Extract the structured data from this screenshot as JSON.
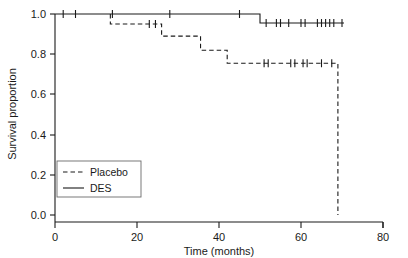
{
  "chart_data": {
    "type": "line",
    "title": "",
    "xlabel": "Time (months)",
    "ylabel": "Survival proportion",
    "xlim": [
      0,
      80
    ],
    "ylim": [
      0.0,
      1.0
    ],
    "grid": false,
    "legend_position": "lower left",
    "xticks": [
      0,
      20,
      40,
      60,
      80
    ],
    "xtick_labels": [
      "0",
      "20",
      "40",
      "60",
      "80"
    ],
    "yticks": [
      0.0,
      0.2,
      0.4,
      0.6,
      0.8,
      1.0
    ],
    "ytick_labels": [
      "0.0",
      "0.2",
      "0.4",
      "0.6",
      "0.8",
      "1.0"
    ],
    "series": [
      {
        "name": "Placebo",
        "style": "dashed",
        "color": "#1a1a1a",
        "step_points": [
          {
            "t": 13.5,
            "s": 1.0
          },
          {
            "t": 13.5,
            "s": 0.95
          },
          {
            "t": 26.0,
            "s": 0.95
          },
          {
            "t": 26.0,
            "s": 0.89
          },
          {
            "t": 35.5,
            "s": 0.89
          },
          {
            "t": 35.5,
            "s": 0.82
          },
          {
            "t": 42.0,
            "s": 0.82
          },
          {
            "t": 42.0,
            "s": 0.755
          },
          {
            "t": 69.0,
            "s": 0.755
          },
          {
            "t": 69.0,
            "s": 0.0
          }
        ],
        "censor_times": [
          23.0,
          24.5,
          51.0,
          52.0,
          57.5,
          58.5,
          60.5,
          61.5,
          65.0,
          67.5
        ],
        "censor_values": [
          0.95,
          0.95,
          0.755,
          0.755,
          0.755,
          0.755,
          0.755,
          0.755,
          0.755,
          0.755
        ]
      },
      {
        "name": "DES",
        "style": "solid",
        "color": "#1a1a1a",
        "step_points": [
          {
            "t": 0.0,
            "s": 1.0
          },
          {
            "t": 50.0,
            "s": 1.0
          },
          {
            "t": 50.0,
            "s": 0.955
          },
          {
            "t": 70.5,
            "s": 0.955
          }
        ],
        "censor_times": [
          2.0,
          5.0,
          14.0,
          28.0,
          45.0,
          51.5,
          54.0,
          55.0,
          57.0,
          60.0,
          61.0,
          64.0,
          65.0,
          66.0,
          67.0,
          68.0,
          70.0
        ],
        "censor_values": [
          1.0,
          1.0,
          1.0,
          1.0,
          1.0,
          0.955,
          0.955,
          0.955,
          0.955,
          0.955,
          0.955,
          0.955,
          0.955,
          0.955,
          0.955,
          0.955,
          0.955
        ]
      }
    ]
  },
  "legend": {
    "entries": [
      {
        "label": "Placebo",
        "style": "dashed"
      },
      {
        "label": "DES",
        "style": "solid"
      }
    ]
  },
  "axes": {
    "x_title": "Time (months)",
    "y_title": "Survival proportion"
  }
}
